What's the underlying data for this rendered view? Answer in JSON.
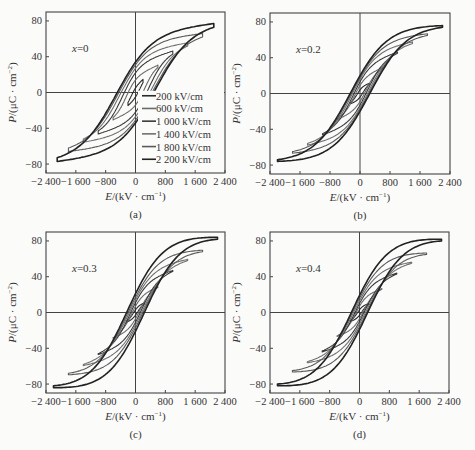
{
  "chart_data": [
    {
      "type": "line",
      "panel_label": "(a)",
      "annotation": "x=0",
      "xlabel": "E/(kV · cm⁻¹)",
      "ylabel": "P/(μC · cm⁻²)",
      "xlim": [
        -2400,
        2400
      ],
      "ylim": [
        -90,
        90
      ],
      "xticks": [
        -2400,
        -1600,
        -800,
        0,
        800,
        1600,
        2400
      ],
      "xtick_labels": [
        "−2 400",
        "−1 600",
        "−800",
        "0",
        "800",
        "1 600",
        "2 400"
      ],
      "yticks": [
        -80,
        -40,
        0,
        40,
        80
      ],
      "ytick_labels": [
        "−80",
        "−40",
        "0",
        "40",
        "80"
      ],
      "legend": {
        "position": "lower right",
        "entries": [
          "200 kV/cm",
          "600 kV/cm",
          "1 000 kV/cm",
          "1 400 kV/cm",
          "1 800 kV/cm",
          "2 200 kV/cm"
        ]
      },
      "series": [
        {
          "name": "200 kV/cm",
          "Emax": 200,
          "Pmax": 11,
          "Pr": 5,
          "Ec": 120,
          "color": "#2a2a2a"
        },
        {
          "name": "600 kV/cm",
          "Emax": 600,
          "Pmax": 28,
          "Pr": 14,
          "Ec": 250,
          "color": "#6a6a6a"
        },
        {
          "name": "1 000 kV/cm",
          "Emax": 1000,
          "Pmax": 43,
          "Pr": 22,
          "Ec": 350,
          "color": "#3a3a3a"
        },
        {
          "name": "1 400 kV/cm",
          "Emax": 1400,
          "Pmax": 52,
          "Pr": 27,
          "Ec": 420,
          "color": "#707070"
        },
        {
          "name": "1 800 kV/cm",
          "Emax": 1800,
          "Pmax": 62,
          "Pr": 31,
          "Ec": 470,
          "color": "#5a5a5a"
        },
        {
          "name": "2 200 kV/cm",
          "Emax": 2100,
          "Pmax": 73,
          "Pr": 34,
          "Ec": 520,
          "color": "#222222"
        }
      ]
    },
    {
      "type": "line",
      "panel_label": "(b)",
      "annotation": "x=0.2",
      "xlabel": "E/(kV · cm⁻¹)",
      "ylabel": "P/(μC · cm⁻²)",
      "xlim": [
        -2400,
        2400
      ],
      "ylim": [
        -90,
        90
      ],
      "xticks": [
        -2400,
        -1600,
        -800,
        0,
        800,
        1600,
        2400
      ],
      "xtick_labels": [
        "−2 400",
        "−1 600",
        "−800",
        "0",
        "800",
        "1 600",
        "2 400"
      ],
      "yticks": [
        -80,
        -40,
        0,
        40,
        80
      ],
      "ytick_labels": [
        "−80",
        "−40",
        "0",
        "40",
        "80"
      ],
      "series": [
        {
          "name": "200 kV/cm",
          "Emax": 250,
          "Pmax": 10,
          "Pr": 4,
          "Ec": 80,
          "color": "#2a2a2a"
        },
        {
          "name": "600 kV/cm",
          "Emax": 600,
          "Pmax": 28,
          "Pr": 9,
          "Ec": 150,
          "color": "#6a6a6a"
        },
        {
          "name": "1 000 kV/cm",
          "Emax": 1000,
          "Pmax": 45,
          "Pr": 13,
          "Ec": 190,
          "color": "#3a3a3a"
        },
        {
          "name": "1 400 kV/cm",
          "Emax": 1400,
          "Pmax": 56,
          "Pr": 16,
          "Ec": 220,
          "color": "#707070"
        },
        {
          "name": "1 800 kV/cm",
          "Emax": 1800,
          "Pmax": 65,
          "Pr": 18,
          "Ec": 240,
          "color": "#5a5a5a"
        },
        {
          "name": "2 200 kV/cm",
          "Emax": 2200,
          "Pmax": 74,
          "Pr": 20,
          "Ec": 260,
          "color": "#222222"
        }
      ]
    },
    {
      "type": "line",
      "panel_label": "(c)",
      "annotation": "x=0.3",
      "xlabel": "E/(kV · cm⁻¹)",
      "ylabel": "P/(μC · cm⁻²)",
      "xlim": [
        -2400,
        2400
      ],
      "ylim": [
        -90,
        90
      ],
      "xticks": [
        -2400,
        -1600,
        -800,
        0,
        800,
        1600,
        2400
      ],
      "xtick_labels": [
        "−2 400",
        "−1 600",
        "−800",
        "0",
        "800",
        "1 600",
        "2 400"
      ],
      "yticks": [
        -80,
        -40,
        0,
        40,
        80
      ],
      "ytick_labels": [
        "−80",
        "−40",
        "0",
        "40",
        "80"
      ],
      "series": [
        {
          "name": "200 kV/cm",
          "Emax": 250,
          "Pmax": 10,
          "Pr": 3,
          "Ec": 60,
          "color": "#2a2a2a"
        },
        {
          "name": "600 kV/cm",
          "Emax": 600,
          "Pmax": 28,
          "Pr": 7,
          "Ec": 110,
          "color": "#6a6a6a"
        },
        {
          "name": "1 000 kV/cm",
          "Emax": 1000,
          "Pmax": 46,
          "Pr": 11,
          "Ec": 150,
          "color": "#3a3a3a"
        },
        {
          "name": "1 400 kV/cm",
          "Emax": 1400,
          "Pmax": 58,
          "Pr": 14,
          "Ec": 180,
          "color": "#707070"
        },
        {
          "name": "1 800 kV/cm",
          "Emax": 1800,
          "Pmax": 68,
          "Pr": 17,
          "Ec": 200,
          "color": "#5a5a5a"
        },
        {
          "name": "2 200 kV/cm",
          "Emax": 2200,
          "Pmax": 82,
          "Pr": 21,
          "Ec": 230,
          "color": "#222222"
        }
      ]
    },
    {
      "type": "line",
      "panel_label": "(d)",
      "annotation": "x=0.4",
      "xlabel": "E/(kV · cm⁻¹)",
      "ylabel": "P/(μC · cm⁻²)",
      "xlim": [
        -2400,
        2400
      ],
      "ylim": [
        -90,
        90
      ],
      "xticks": [
        -2400,
        -1600,
        -800,
        0,
        800,
        1600,
        2400
      ],
      "xtick_labels": [
        "−2 400",
        "−1 600",
        "−800",
        "0",
        "800",
        "1 600",
        "2 400"
      ],
      "yticks": [
        -80,
        -40,
        0,
        40,
        80
      ],
      "ytick_labels": [
        "−80",
        "−40",
        "0",
        "40",
        "80"
      ],
      "series": [
        {
          "name": "200 kV/cm",
          "Emax": 250,
          "Pmax": 9,
          "Pr": 3,
          "Ec": 60,
          "color": "#2a2a2a"
        },
        {
          "name": "600 kV/cm",
          "Emax": 600,
          "Pmax": 26,
          "Pr": 7,
          "Ec": 110,
          "color": "#6a6a6a"
        },
        {
          "name": "1 000 kV/cm",
          "Emax": 1000,
          "Pmax": 43,
          "Pr": 10,
          "Ec": 140,
          "color": "#3a3a3a"
        },
        {
          "name": "1 400 kV/cm",
          "Emax": 1400,
          "Pmax": 55,
          "Pr": 13,
          "Ec": 170,
          "color": "#707070"
        },
        {
          "name": "1 800 kV/cm",
          "Emax": 1800,
          "Pmax": 65,
          "Pr": 16,
          "Ec": 190,
          "color": "#5a5a5a"
        },
        {
          "name": "2 200 kV/cm",
          "Emax": 2200,
          "Pmax": 80,
          "Pr": 19,
          "Ec": 210,
          "color": "#222222"
        }
      ]
    }
  ]
}
